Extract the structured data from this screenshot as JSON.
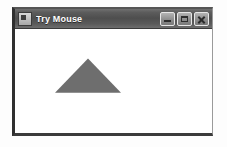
{
  "window": {
    "title": "Try Mouse",
    "icon": "application-icon",
    "frame_color": "#2f2f2f",
    "titlebar_color": "#4e4e4e",
    "title_text_color": "#ffffff",
    "client_background": "#ffffff",
    "controls": [
      {
        "name": "minimize",
        "label": "Minimize",
        "glyph": "_"
      },
      {
        "name": "maximize",
        "label": "Maximize",
        "glyph": "□"
      },
      {
        "name": "close",
        "label": "Close",
        "glyph": "✕"
      }
    ]
  },
  "canvas": {
    "description": "Filled gray triangle drawn on white client area",
    "shape": {
      "type": "triangle",
      "fill_color": "#6e6e6e",
      "apex": {
        "x": 73,
        "y": 30
      },
      "left_base": {
        "x": 40,
        "y": 65
      },
      "right_base": {
        "x": 106,
        "y": 65
      },
      "points": "73,30 106,65 40,65"
    }
  }
}
